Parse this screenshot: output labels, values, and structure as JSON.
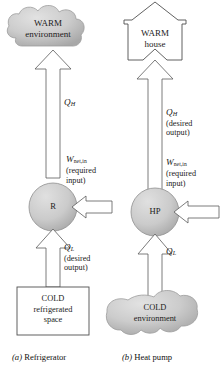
{
  "figure": {
    "colors": {
      "cloud_fill": "#c9c9c9",
      "cloud_edge": "#9a9a9a",
      "device_fill": "#cccccc",
      "device_edge": "#8c8c8c",
      "outline": "#555555",
      "text": "#1a1a1a",
      "background": "#ffffff"
    }
  },
  "refrigerator": {
    "caption_letter": "(a)",
    "caption_text": "Refrigerator",
    "hot_reservoir": {
      "line1": "WARM",
      "line2": "environment",
      "shape": "cloud"
    },
    "cold_reservoir": {
      "line1": "COLD",
      "line2": "refrigerated",
      "line3": "space",
      "shape": "rectangle"
    },
    "device": {
      "label": "R",
      "shape": "circle"
    },
    "heat_out": {
      "symbol": "Q",
      "subscript": "H",
      "note": ""
    },
    "heat_in": {
      "symbol": "Q",
      "subscript": "L",
      "note_line1": "(desired",
      "note_line2": "output)"
    },
    "work_in": {
      "symbol": "W",
      "subscript": "net,in",
      "note_line1": "(required",
      "note_line2": "input)"
    }
  },
  "heat_pump": {
    "caption_letter": "(b)",
    "caption_text": "Heat pump",
    "hot_reservoir": {
      "line1": "WARM",
      "line2": "house",
      "shape": "house"
    },
    "cold_reservoir": {
      "line1": "COLD",
      "line2": "environment",
      "shape": "cloud"
    },
    "device": {
      "label": "HP",
      "shape": "circle"
    },
    "heat_out": {
      "symbol": "Q",
      "subscript": "H",
      "note_line1": "(desired",
      "note_line2": "output)"
    },
    "heat_in": {
      "symbol": "Q",
      "subscript": "L",
      "note": ""
    },
    "work_in": {
      "symbol": "W",
      "subscript": "net,in",
      "note_line1": "(required",
      "note_line2": "input)"
    }
  }
}
